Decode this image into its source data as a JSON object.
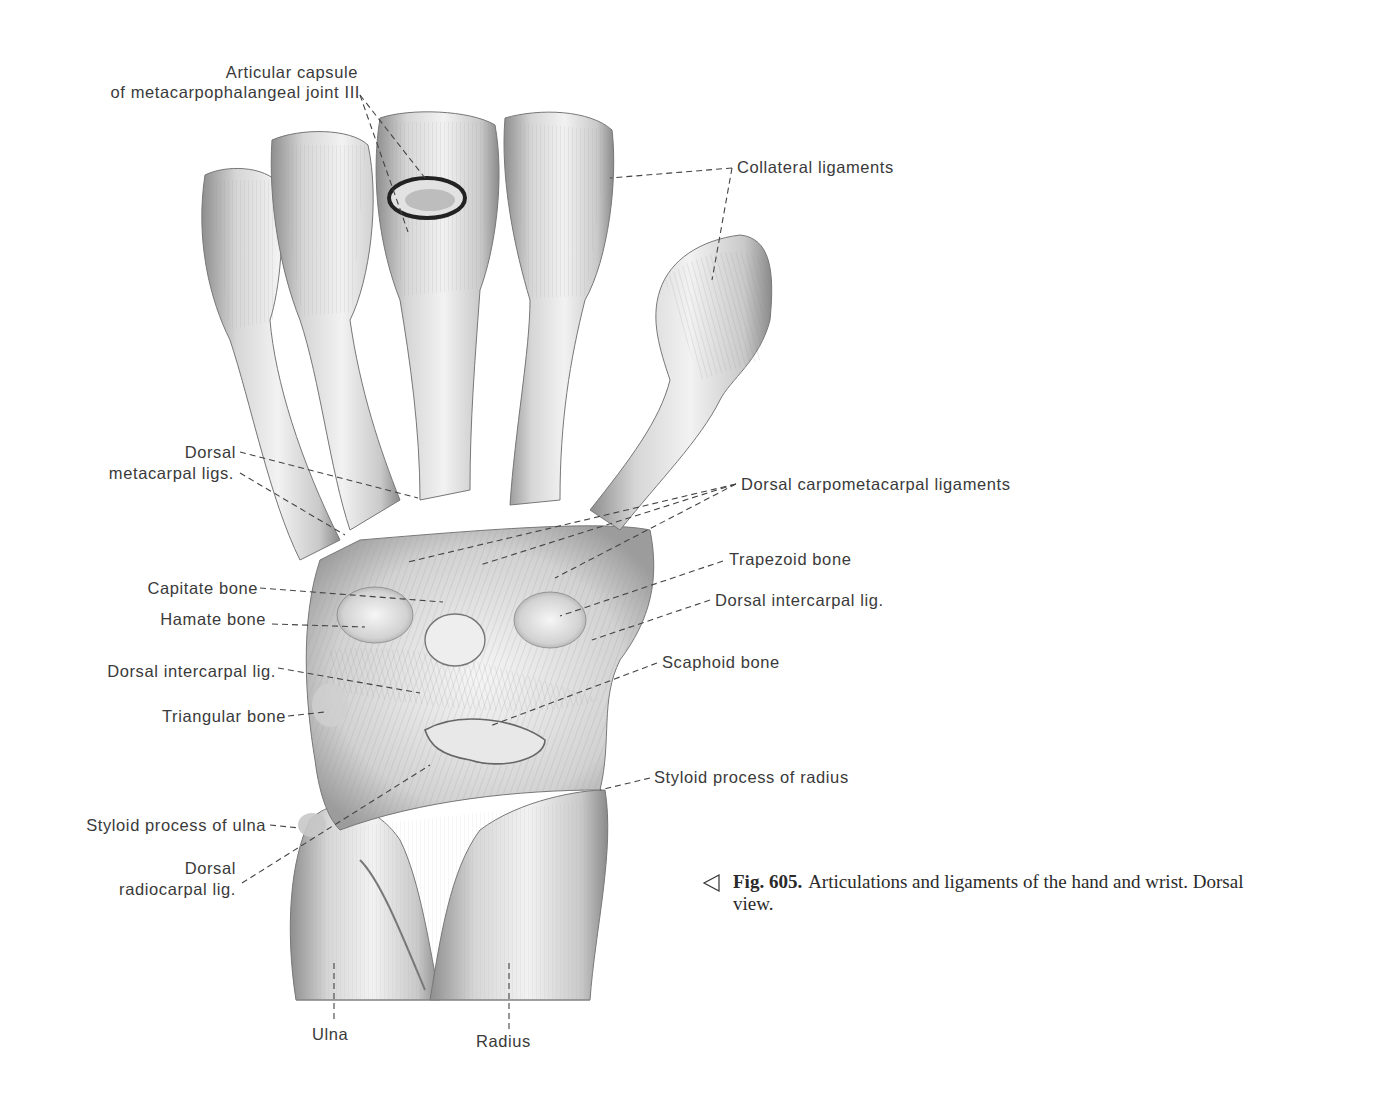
{
  "figure": {
    "number": "Fig. 605.",
    "caption_line1": "Articulations and ligaments of the hand and wrist. Dorsal",
    "caption_line2": "view.",
    "pointer_icon": "left-triangle-outline",
    "view": "Dorsal view"
  },
  "labels": {
    "articular_capsule_l1": "Articular capsule",
    "articular_capsule_l2": "of metacarpophalangeal joint III",
    "collateral_ligaments": "Collateral ligaments",
    "dorsal_metacarpal_l1": "Dorsal",
    "dorsal_metacarpal_l2": "metacarpal ligs.",
    "dorsal_carpometacarpal": "Dorsal carpometacarpal ligaments",
    "trapezoid_bone": "Trapezoid bone",
    "capitate_bone": "Capitate bone",
    "dorsal_intercarpal_right": "Dorsal intercarpal lig.",
    "hamate_bone": "Hamate bone",
    "scaphoid_bone": "Scaphoid bone",
    "dorsal_intercarpal_left": "Dorsal intercarpal lig.",
    "triangular_bone": "Triangular bone",
    "styloid_radius": "Styloid process of radius",
    "styloid_ulna": "Styloid process of ulna",
    "dorsal_radiocarpal_l1": "Dorsal",
    "dorsal_radiocarpal_l2": "radiocarpal lig.",
    "ulna": "Ulna",
    "radius": "Radius"
  },
  "colors": {
    "background": "#ffffff",
    "text": "#3a3a3a",
    "leader": "#444444",
    "bone_light": "#f0f0f0",
    "bone_mid": "#c4c4c4",
    "bone_dark": "#8a8a8a"
  }
}
